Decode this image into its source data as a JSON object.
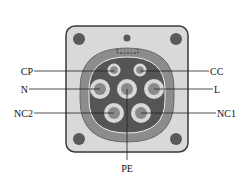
{
  "diagram": {
    "colors": {
      "plate_fill": "#d9d9d9",
      "plate_stroke": "#3a3a3a",
      "screw_hole": "#5a5a5a",
      "outer_ring": "#8c8c8c",
      "inner_face": "#555555",
      "pin_ring": "#d8d8d8",
      "pin_core": "#8a8a8a",
      "line": "#222222"
    },
    "pins": [
      {
        "id": "CP",
        "label": "CP",
        "side": "left"
      },
      {
        "id": "CC",
        "label": "CC",
        "side": "right"
      },
      {
        "id": "N",
        "label": "N",
        "side": "left"
      },
      {
        "id": "PE",
        "label": "PE",
        "side": "bottom"
      },
      {
        "id": "L",
        "label": "L",
        "side": "right"
      },
      {
        "id": "NC2",
        "label": "NC2",
        "side": "left"
      },
      {
        "id": "NC1",
        "label": "NC1",
        "side": "right"
      }
    ]
  }
}
